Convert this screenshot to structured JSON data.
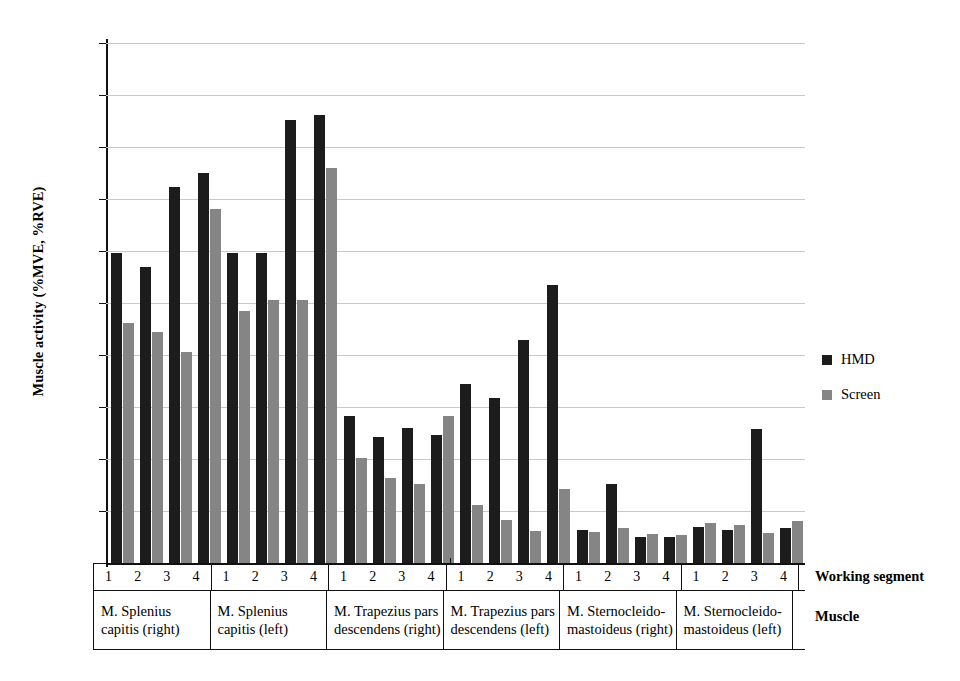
{
  "chart_data": {
    "type": "bar",
    "title": "",
    "xlabel": "",
    "ylabel": "Muscle activity (%MVE, %RVE)",
    "ylim": [
      0,
      50
    ],
    "yticks": [
      0,
      5,
      10,
      15,
      20,
      25,
      30,
      35,
      40,
      45,
      50
    ],
    "grid": true,
    "legend_position": "right",
    "group_axis_label": "Muscle",
    "segment_axis_label": "Working segment",
    "segments": [
      "1",
      "2",
      "3",
      "4"
    ],
    "groups": [
      "M. Splenius capitis (right)",
      "M. Splenius capitis (left)",
      "M. Trapezius pars descendens (right)",
      "M. Trapezius pars descendens (left)",
      "M. Sternocleido-mastoideus (right)",
      "M. Sternocleido-mastoideus (left)"
    ],
    "series": [
      {
        "name": "HMD",
        "color": "#1c1c1c",
        "values": [
          [
            29.8,
            28.5,
            36.2,
            37.5
          ],
          [
            29.8,
            29.8,
            42.6,
            43.1
          ],
          [
            14.1,
            12.1,
            13.0,
            12.3
          ],
          [
            17.2,
            15.9,
            21.4,
            26.7
          ],
          [
            3.2,
            7.6,
            2.5,
            2.5
          ],
          [
            3.5,
            3.2,
            12.9,
            3.4
          ]
        ]
      },
      {
        "name": "Screen",
        "color": "#858585",
        "values": [
          [
            23.1,
            22.2,
            20.3,
            34.0
          ],
          [
            24.2,
            25.3,
            25.3,
            38.0
          ],
          [
            10.1,
            8.2,
            7.6,
            14.1
          ],
          [
            5.6,
            4.1,
            3.1,
            7.1
          ],
          [
            3.0,
            3.4,
            2.8,
            2.7
          ],
          [
            3.8,
            3.7,
            2.9,
            4.0
          ]
        ]
      }
    ]
  },
  "legend": {
    "items": [
      {
        "label": "HMD",
        "color": "#1c1c1c"
      },
      {
        "label": "Screen",
        "color": "#858585"
      }
    ]
  },
  "axis": {
    "y_title": "Muscle activity (%MVE, %RVE)",
    "row_header_segment": "Working segment",
    "row_header_muscle": "Muscle"
  }
}
